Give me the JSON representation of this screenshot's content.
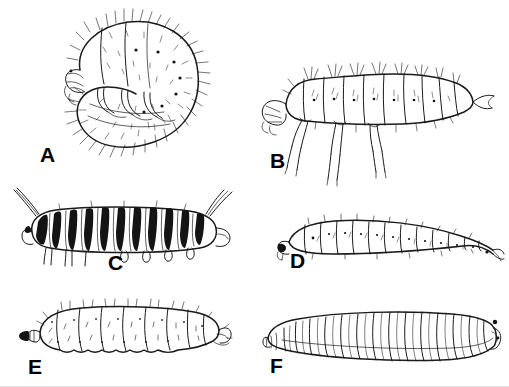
{
  "plate": {
    "title": "Larval body types",
    "background_color": "#ffffff",
    "ink_color": "#1a1a1a",
    "width": 509,
    "height": 387,
    "medium": "pen-and-ink line drawing"
  },
  "panels": [
    {
      "id": "A",
      "label": "A",
      "caption": "Scarabaeiform grub, C-shaped body densely covered with setae, three pairs of thoracic legs, distinct sclerotized head at left",
      "position": "top-left"
    },
    {
      "id": "B",
      "label": "B",
      "caption": "Campodeiform larva, elongate and flattened with well-developed segmentation, three pairs of long thoracic legs and dorsal setal tufts",
      "position": "top-right"
    },
    {
      "id": "C",
      "label": "C",
      "caption": "Eruciform caterpillar with bold dark transverse banding, abdominal prolegs, and long anterior and posterior filaments",
      "position": "middle-left"
    },
    {
      "id": "D",
      "label": "D",
      "caption": "Elateriform larva, slender and gently curved with uniform segments and sparse setae, legless appearance",
      "position": "middle-right"
    },
    {
      "id": "E",
      "label": "E",
      "caption": "Apodous eucephalous larva, stout and legless with small dark head capsule at left and scattered setae",
      "position": "bottom-left"
    },
    {
      "id": "F",
      "label": "F",
      "caption": "Vermiform maggot, acephalous and legless, tapering anteriorly to the left with strongly annulated segments",
      "position": "bottom-right"
    }
  ],
  "labels": {
    "a": "A",
    "b": "B",
    "c": "C",
    "d": "D",
    "e": "E",
    "f": "F"
  }
}
